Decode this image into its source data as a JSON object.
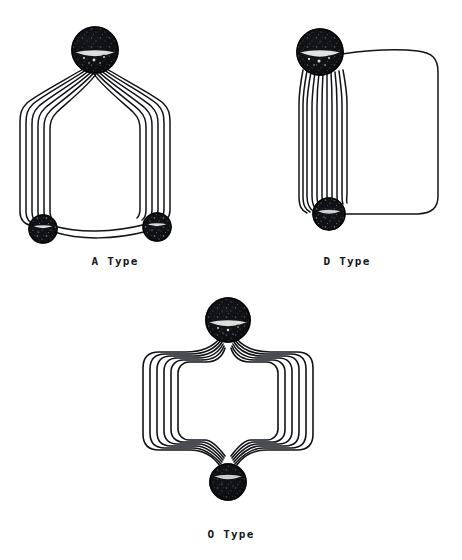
{
  "figure": {
    "background_color": "#ffffff",
    "ink_color": "#121317",
    "description": "Three schematic coil-winding diagrams labelled by type",
    "labels": {
      "a_type": "A Type",
      "d_type": "D Type",
      "o_type": "O Type"
    },
    "diagrams": [
      {
        "id": "a-type",
        "label": "A Type",
        "node_count": 3,
        "winding_count": 6,
        "nodes": [
          {
            "name": "apex-node",
            "cx": 95,
            "cy": 50,
            "r": 23
          },
          {
            "name": "bottom-left-node",
            "cx": 43,
            "cy": 229,
            "r": 14
          },
          {
            "name": "bottom-right-node",
            "cx": 157,
            "cy": 227,
            "r": 14
          }
        ]
      },
      {
        "id": "d-type",
        "label": "D Type",
        "node_count": 2,
        "winding_count": 11,
        "nodes": [
          {
            "name": "top-node",
            "cx": 320,
            "cy": 52,
            "r": 23
          },
          {
            "name": "bottom-node",
            "cx": 329,
            "cy": 214,
            "r": 16
          }
        ]
      },
      {
        "id": "o-type",
        "label": "O Type",
        "node_count": 2,
        "winding_count": 6,
        "nodes": [
          {
            "name": "top-node",
            "cx": 228,
            "cy": 320,
            "r": 22
          },
          {
            "name": "bottom-node",
            "cx": 228,
            "cy": 482,
            "r": 18
          }
        ]
      }
    ]
  }
}
